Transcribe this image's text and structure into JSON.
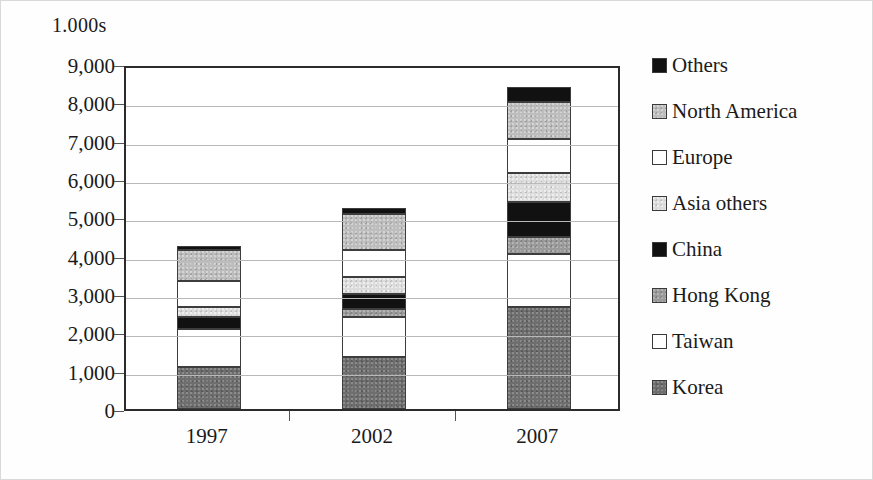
{
  "chart_data": {
    "type": "bar",
    "stacked": true,
    "title": "1.000s",
    "xlabel": "",
    "ylabel": "1.000s",
    "categories": [
      "1997",
      "2002",
      "2007"
    ],
    "ylim": [
      0,
      9000
    ],
    "ytick_labels": [
      "9,000",
      "8,000",
      "7,000",
      "6,000",
      "5,000",
      "4,000",
      "3,000",
      "2,000",
      "1,000",
      "0"
    ],
    "ytick_values": [
      9000,
      8000,
      7000,
      6000,
      5000,
      4000,
      3000,
      2000,
      1000,
      0
    ],
    "grid": true,
    "legend_position": "right",
    "legend_order_top_to_bottom": [
      "Others",
      "North America",
      "Europe",
      "Asia others",
      "China",
      "Hong Kong",
      "Taiwan",
      "Korea"
    ],
    "series": [
      {
        "name": "Korea",
        "color": "#6e6e6e",
        "swatch": "dark-gray",
        "values": [
          1100,
          1350,
          2650
        ]
      },
      {
        "name": "Taiwan",
        "color": "#ffffff",
        "swatch": "white",
        "values": [
          1000,
          1050,
          1400
        ]
      },
      {
        "name": "Hong Kong",
        "color": "#9a9a9a",
        "swatch": "mid-gray",
        "values": [
          0,
          200,
          450
        ]
      },
      {
        "name": "China",
        "color": "#111111",
        "swatch": "black",
        "values": [
          300,
          400,
          900
        ]
      },
      {
        "name": "Asia others",
        "color": "#dcdcdc",
        "swatch": "light-gray",
        "values": [
          250,
          450,
          750
        ]
      },
      {
        "name": "Europe",
        "color": "#ffffff",
        "swatch": "white",
        "values": [
          700,
          700,
          900
        ]
      },
      {
        "name": "North America",
        "color": "#bdbdbd",
        "swatch": "gray",
        "values": [
          800,
          950,
          950
        ]
      },
      {
        "name": "Others",
        "color": "#111111",
        "swatch": "black",
        "values": [
          100,
          150,
          400
        ]
      }
    ],
    "totals": [
      4250,
      5250,
      8400
    ]
  },
  "axis": {
    "title": "1.000s"
  },
  "legend": {
    "items": [
      {
        "label": "Others",
        "swatch": "black"
      },
      {
        "label": "North America",
        "swatch": "gray"
      },
      {
        "label": "Europe",
        "swatch": "white"
      },
      {
        "label": "Asia others",
        "swatch": "light-gray"
      },
      {
        "label": "China",
        "swatch": "black"
      },
      {
        "label": "Hong Kong",
        "swatch": "mid-gray"
      },
      {
        "label": "Taiwan",
        "swatch": "white"
      },
      {
        "label": "Korea",
        "swatch": "dark-gray"
      }
    ]
  }
}
